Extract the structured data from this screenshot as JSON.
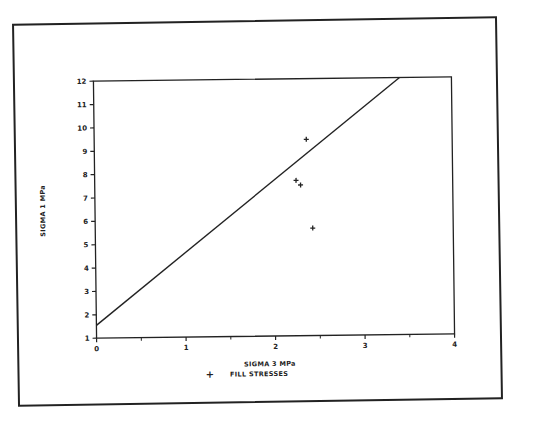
{
  "chart_data": {
    "type": "scatter",
    "title": "",
    "xlabel": "SIGMA 3 MPa",
    "ylabel": "SIGMA 1 MPa",
    "xlim": [
      0,
      4
    ],
    "ylim": [
      1,
      12
    ],
    "x_ticks": [
      "0",
      "1",
      "2",
      "3",
      "4"
    ],
    "x_minor_ticks": [
      0.5,
      1.5,
      2.5,
      3.5
    ],
    "y_ticks": [
      "1",
      "2",
      "3",
      "4",
      "5",
      "6",
      "7",
      "8",
      "9",
      "10",
      "11",
      "12"
    ],
    "grid": false,
    "legend": {
      "position": "bottom",
      "entries": [
        {
          "marker": "+",
          "label": "FILL STRESSES"
        }
      ]
    },
    "series": [
      {
        "name": "FILL STRESSES",
        "type": "scatter",
        "marker": "+",
        "points": [
          {
            "x": 2.37,
            "y": 9.4
          },
          {
            "x": 2.25,
            "y": 7.65
          },
          {
            "x": 2.3,
            "y": 7.45
          },
          {
            "x": 2.43,
            "y": 5.6
          }
        ]
      },
      {
        "name": "failure envelope",
        "type": "line",
        "points": [
          {
            "x": 0,
            "y": 1.55
          },
          {
            "x": 3.42,
            "y": 12.0
          }
        ]
      }
    ]
  },
  "labels": {
    "xlabel": "SIGMA 3 MPa",
    "ylabel": "SIGMA 1 MPa",
    "legend_marker": "+",
    "legend_label": "FILL STRESSES"
  },
  "colors": {
    "ink": "#222222",
    "background": "#ffffff"
  }
}
